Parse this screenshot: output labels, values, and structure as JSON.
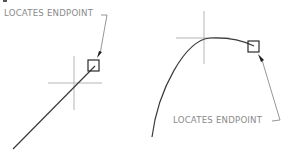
{
  "figures": [
    {
      "id": "line-endpoint",
      "label": "LOCATES  ENDPOINT",
      "description": "Endpoint snap on a straight line"
    },
    {
      "id": "arc-endpoint",
      "label": "LOCATES  ENDPOINT",
      "description": "Endpoint snap on an arc"
    }
  ],
  "colors": {
    "geometry": "#3a3a3a",
    "crosshair": "#b5b5b5",
    "leader": "#8a8a8a",
    "label": "#8a8a8a",
    "background": "#ffffff"
  }
}
